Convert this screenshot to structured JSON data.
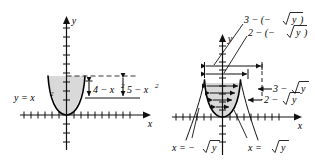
{
  "figure": {
    "type": "math-diagram",
    "panels": [
      {
        "id": "left-panel",
        "axis_labels": {
          "x": "x",
          "y": "y"
        },
        "curve_label": "y = x²",
        "curve_label_parts": {
          "base": "y  =  x",
          "exponent": "2"
        },
        "annotations": [
          {
            "id": "inner-length",
            "text": "4 − x²",
            "parts": {
              "base": "4  −  x",
              "exponent": "2"
            }
          },
          {
            "id": "outer-length",
            "text": "5 − x²",
            "parts": {
              "base": "5  −  x",
              "exponent": "2"
            }
          }
        ]
      },
      {
        "id": "right-panel",
        "axis_labels": {
          "x": "x",
          "y": "y"
        },
        "curve_labels": [
          {
            "id": "left-branch",
            "text": "x = −√y",
            "parts": {
              "lead": "x  =  −",
              "radical": "y"
            }
          },
          {
            "id": "right-branch",
            "text": "x = √y",
            "parts": {
              "lead": "x  =  ",
              "radical": "y"
            }
          }
        ],
        "annotations": [
          {
            "id": "upper-outer",
            "text": "3 − (−√y)",
            "parts": {
              "lead": "3  −  (−",
              "radical": "y",
              "tail": ")"
            }
          },
          {
            "id": "upper-inner",
            "text": "2 − (−√y)",
            "parts": {
              "lead": "2  −  (−",
              "radical": "y",
              "tail": ")"
            }
          },
          {
            "id": "lower-outer",
            "text": "3 − √y",
            "parts": {
              "lead": "3  −  ",
              "radical": "y"
            }
          },
          {
            "id": "lower-inner",
            "text": "2 − √y",
            "parts": {
              "lead": "2  −  ",
              "radical": "y"
            }
          }
        ]
      }
    ],
    "colors": {
      "ink": "#111111",
      "region_fill": "#d9d9d9",
      "curve": "#000000",
      "dashed": "#333333"
    }
  }
}
